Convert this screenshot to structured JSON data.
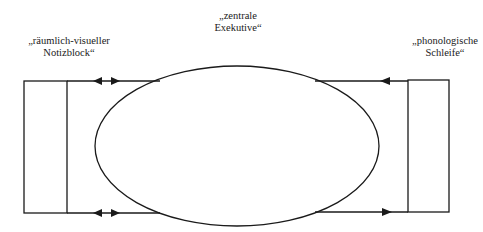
{
  "diagram": {
    "components": [
      {
        "id": "visuospatial",
        "label_line1": "„räumlich-visueller",
        "label_line2": "Notizblock“"
      },
      {
        "id": "central",
        "label_line1": "„zentrale",
        "label_line2": "Exekutive“"
      },
      {
        "id": "phonological",
        "label_line1": "„phonologische",
        "label_line2": "Schleife“"
      }
    ],
    "connections": [
      {
        "from": "central",
        "to": "visuospatial",
        "type": "bidirectional",
        "position": "top"
      },
      {
        "from": "central",
        "to": "visuospatial",
        "type": "bidirectional",
        "position": "bottom"
      },
      {
        "from": "phonological",
        "to": "central",
        "type": "unidirectional",
        "position": "top"
      },
      {
        "from": "central",
        "to": "phonological",
        "type": "unidirectional",
        "position": "bottom"
      }
    ],
    "colors": {
      "stroke": "#1a1a1a",
      "background": "#ffffff"
    }
  }
}
